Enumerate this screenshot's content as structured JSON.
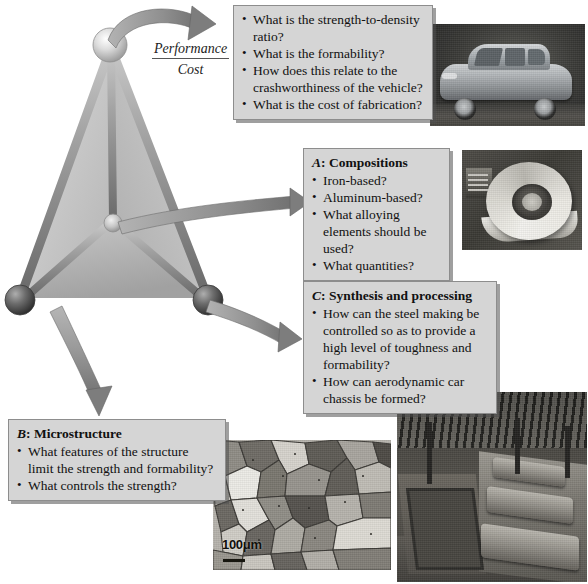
{
  "figure": {
    "ratio_label": {
      "numerator": "Performance",
      "denominator": "Cost"
    }
  },
  "boxes": {
    "performance": {
      "name": "performance-cost-questions",
      "title": "",
      "bullets": [
        "What is the strength-to-density ratio?",
        "What is the formability?",
        "How does this relate to the crashworthiness of the vehicle?",
        "What is the cost of fabrication?"
      ]
    },
    "a": {
      "name": "compositions",
      "letter": "A",
      "title_rest": ": Compositions",
      "bullets": [
        "Iron-based?",
        "Aluminum-based?",
        "What alloying elements should be used?",
        "What quantities?"
      ]
    },
    "b": {
      "name": "microstructure",
      "letter": "B",
      "title_rest": ": Microstructure",
      "bullets": [
        "What features of the structure limit the strength and formability?",
        "What controls the strength?"
      ]
    },
    "c": {
      "name": "synthesis-and-processing",
      "letter": "C",
      "title_rest": ": Synthesis and processing",
      "bullets": [
        "How can the steel making be controlled so as to provide a high level of toughness and formability?",
        "How can aerodynamic car chassis be formed?"
      ]
    }
  },
  "photos": {
    "car": {
      "caption": "car-photograph"
    },
    "coil": {
      "caption": "steel-coil-photograph"
    },
    "factory": {
      "caption": "automotive-assembly-line-photograph"
    },
    "micrograph": {
      "caption": "grain-microstructure-micrograph",
      "scale_label": "100μm"
    }
  },
  "colors": {
    "box_fill": "#d5d5d5",
    "box_border": "#8d8d8d",
    "arrow_gray": "#8a8a8a",
    "tetra_face": "#c9c9c9",
    "node_light": "#e6e6e6",
    "node_dark": "#4a4a4a"
  }
}
